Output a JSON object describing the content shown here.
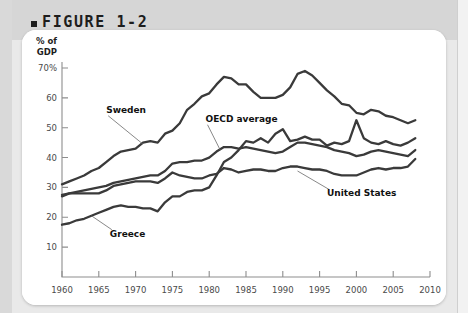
{
  "figure": {
    "bullet": "■",
    "title": "FIGURE 1-2"
  },
  "chart_data": {
    "type": "line",
    "title": "FIGURE 1-2",
    "xlabel": "",
    "ylabel": "% of GDP",
    "ylabel_line1": "% of",
    "ylabel_line2": "GDP",
    "grid": false,
    "legend_position": "inline-annotations",
    "xlim": [
      1960,
      2010
    ],
    "ylim": [
      0,
      72
    ],
    "xticks": [
      1960,
      1965,
      1970,
      1975,
      1980,
      1985,
      1990,
      1995,
      2000,
      2005,
      2010
    ],
    "xtick_labels": [
      "1960",
      "1965",
      "1970",
      "1975",
      "1980",
      "1985",
      "1990",
      "1995",
      "2000",
      "2005",
      "2010"
    ],
    "yticks": [
      10,
      20,
      30,
      40,
      50,
      60,
      70
    ],
    "ytick_labels": [
      "10",
      "20",
      "30",
      "40",
      "50",
      "60",
      "70%"
    ],
    "x": [
      1960,
      1961,
      1962,
      1963,
      1964,
      1965,
      1966,
      1967,
      1968,
      1969,
      1970,
      1971,
      1972,
      1973,
      1974,
      1975,
      1976,
      1977,
      1978,
      1979,
      1980,
      1981,
      1982,
      1983,
      1984,
      1985,
      1986,
      1987,
      1988,
      1989,
      1990,
      1991,
      1992,
      1993,
      1994,
      1995,
      1996,
      1997,
      1998,
      1999,
      2000,
      2001,
      2002,
      2003,
      2004,
      2005,
      2006,
      2007,
      2008
    ],
    "series": [
      {
        "name": "Sweden",
        "label": "Sweden",
        "values": [
          31.0,
          32.0,
          33.0,
          34.0,
          35.5,
          36.5,
          38.5,
          40.5,
          42.0,
          42.5,
          43.0,
          45.0,
          45.5,
          45.0,
          48.0,
          49.0,
          51.5,
          56.0,
          58.0,
          60.5,
          61.5,
          64.5,
          67.0,
          66.5,
          64.5,
          64.5,
          62.0,
          60.0,
          60.0,
          60.0,
          61.0,
          63.5,
          68.0,
          69.0,
          67.5,
          65.0,
          62.5,
          60.5,
          58.0,
          57.5,
          55.0,
          54.5,
          56.0,
          55.5,
          54.0,
          53.5,
          52.5,
          51.5,
          52.5
        ],
        "label_x": 1966.0,
        "label_y": 55.0,
        "leader_to_x": 1971.0,
        "leader_to_y": 44.5
      },
      {
        "name": "OECD average",
        "label": "OECD average",
        "values": [
          27.5,
          28.0,
          28.5,
          29.0,
          29.5,
          30.0,
          30.5,
          31.5,
          32.0,
          32.5,
          33.0,
          33.5,
          34.0,
          34.0,
          35.5,
          38.0,
          38.5,
          38.5,
          39.0,
          39.0,
          40.0,
          42.0,
          43.5,
          43.5,
          43.0,
          43.5,
          43.0,
          42.5,
          42.0,
          41.5,
          42.0,
          43.5,
          45.0,
          45.0,
          44.5,
          44.0,
          43.5,
          42.5,
          42.0,
          41.5,
          40.5,
          41.0,
          42.0,
          42.5,
          42.0,
          41.5,
          41.0,
          40.5,
          42.5
        ],
        "label_x": 1979.5,
        "label_y": 52.0,
        "leader_to_x": 1981.5,
        "leader_to_y": 42.5
      },
      {
        "name": "United States",
        "label": "United States",
        "values": [
          27.0,
          28.0,
          28.0,
          28.0,
          28.0,
          28.0,
          29.0,
          30.5,
          31.0,
          31.5,
          32.0,
          32.0,
          32.0,
          31.5,
          33.0,
          35.0,
          34.0,
          33.5,
          33.0,
          33.0,
          34.0,
          34.5,
          36.5,
          36.0,
          35.0,
          35.5,
          36.0,
          36.0,
          35.5,
          35.5,
          36.5,
          37.0,
          37.0,
          36.5,
          36.0,
          36.0,
          35.5,
          34.5,
          34.0,
          34.0,
          34.0,
          35.0,
          36.0,
          36.5,
          36.0,
          36.5,
          36.5,
          37.0,
          39.5
        ],
        "label_x": 1996.0,
        "label_y": 27.0,
        "leader_to_x": 1992.0,
        "leader_to_y": 35.5
      },
      {
        "name": "Greece",
        "label": "Greece",
        "values": [
          17.5,
          18.0,
          19.0,
          19.5,
          20.5,
          21.5,
          22.5,
          23.5,
          24.0,
          23.5,
          23.5,
          23.0,
          23.0,
          22.0,
          25.0,
          27.0,
          27.0,
          28.5,
          29.0,
          29.0,
          30.0,
          34.0,
          38.5,
          40.0,
          42.5,
          45.5,
          45.0,
          46.5,
          45.0,
          48.0,
          49.5,
          45.5,
          46.0,
          47.0,
          46.0,
          46.0,
          44.0,
          45.0,
          44.5,
          45.5,
          52.5,
          46.5,
          45.0,
          44.5,
          45.5,
          44.5,
          44.0,
          45.0,
          46.5
        ],
        "label_x": 1966.5,
        "label_y": 13.5,
        "leader_to_x": 1964.0,
        "leader_to_y": 20.5
      }
    ]
  },
  "colors": {
    "line": "#3a3a3a",
    "axis": "#8d8d8d",
    "tick_text": "#4a4a4a",
    "title_text": "#1d1d1d",
    "header_band": "#d6d6d6",
    "page_band": "#e9e9e9",
    "card": "#ffffff"
  }
}
